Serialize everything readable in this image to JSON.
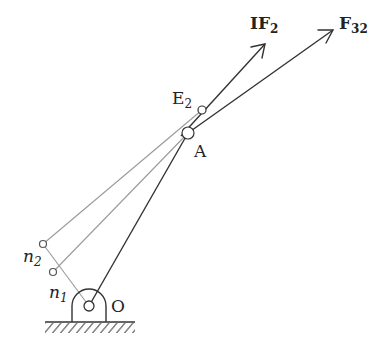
{
  "diagram": {
    "type": "mechanism-force-diagram",
    "labels": {
      "IF2": {
        "main": "IF",
        "sub": "2"
      },
      "F32": {
        "main": "F",
        "sub": "32"
      },
      "E2": {
        "main": "E",
        "sub": "2"
      },
      "A": {
        "main": "A"
      },
      "n2": {
        "main": "n",
        "sub": "2"
      },
      "n1": {
        "main": "n",
        "sub": "1"
      },
      "O": {
        "main": "O"
      }
    },
    "colors": {
      "dark_line": "#333333",
      "gray_line": "#9a9a9a",
      "background": "#ffffff"
    },
    "points": {
      "O": [
        89,
        306
      ],
      "A": [
        188,
        133
      ],
      "E2": [
        202,
        110
      ],
      "n1": [
        53,
        272
      ],
      "n2": [
        43,
        244
      ],
      "IF2_tip": [
        265,
        44
      ],
      "F32_tip": [
        333,
        30
      ]
    }
  }
}
